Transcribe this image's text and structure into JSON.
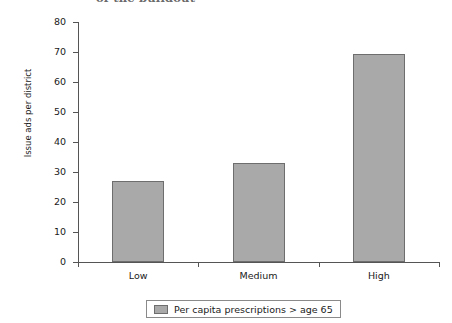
{
  "chart_data": {
    "type": "bar",
    "title": "",
    "title_partial": "of the buildout",
    "categories": [
      "Low",
      "Medium",
      "High"
    ],
    "values": [
      27,
      33,
      69.5
    ],
    "series": [
      {
        "name": "Per capita prescriptions > age 65",
        "values": [
          27,
          33,
          69.5
        ]
      }
    ],
    "xlabel": "",
    "ylabel": "Issue ads per district",
    "ylim": [
      0,
      80
    ],
    "ytick_step": 10,
    "yticks": [
      "0",
      "10",
      "20",
      "30",
      "40",
      "50",
      "60",
      "70",
      "80"
    ],
    "grid": false,
    "legend": {
      "position": "bottom",
      "entries": [
        "Per capita prescriptions > age 65"
      ]
    },
    "colors": {
      "bar_fill": "#a9a9a9",
      "bar_stroke": "#6e6e6e",
      "axis": "#555555",
      "text": "#1a1a1a",
      "background": "#ffffff"
    }
  }
}
